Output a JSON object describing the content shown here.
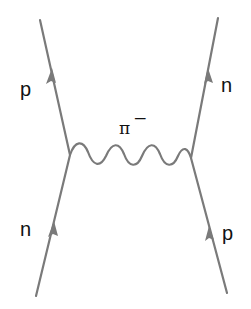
{
  "diagram": {
    "type": "feynman",
    "labels": {
      "top_left": "p",
      "top_right": "n",
      "bottom_left": "n",
      "bottom_right": "p",
      "exchange": "π",
      "exchange_charge": "−"
    },
    "colors": {
      "line": "#7a7a7a",
      "text": "#111111"
    }
  }
}
